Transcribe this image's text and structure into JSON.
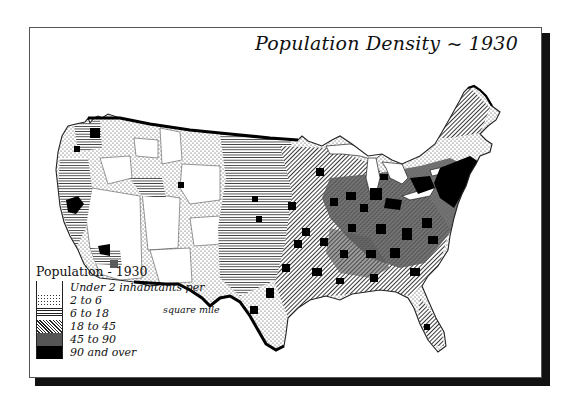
{
  "title": "Population Density ~ 1930",
  "legend": {
    "title": "Population - 1930",
    "subtitle_continuation": "square mile",
    "classes": [
      {
        "label": "Under 2 inhabitants per",
        "pattern": "blank",
        "color": "#ffffff"
      },
      {
        "label": "2 to 6",
        "pattern": "stipple",
        "color": "#e8e8e8"
      },
      {
        "label": "6 to 18",
        "pattern": "horizontal-lines",
        "color": "#c8c8c8"
      },
      {
        "label": "18 to 45",
        "pattern": "diagonal-lines",
        "color": "#999999"
      },
      {
        "label": "45 to 90",
        "pattern": "dense-dots",
        "color": "#555555"
      },
      {
        "label": "90 and over",
        "pattern": "solid",
        "color": "#000000"
      }
    ]
  },
  "map": {
    "region": "United States (contiguous)",
    "year": "1930",
    "variable": "Population density (inhabitants per square mile)"
  }
}
